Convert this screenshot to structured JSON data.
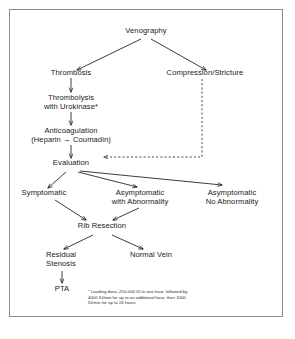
{
  "diagram": {
    "border_color": "#8d8d8d",
    "text_color": "#1a1a1a",
    "background": "#ffffff",
    "nodes": {
      "venography": "Venography",
      "thrombosis": "Thrombosis",
      "compression": "Compression/Stricture",
      "thrombolysis": "Thrombolysis\nwith Urokinase*",
      "anticoagulation": "Anticoagulation\n(Heparin → Coumadin)",
      "evaluation": "Evaluation",
      "symptomatic": "Symptomatic",
      "asymptomatic_abnormal": "Asymptomatic\nwith Abnormality",
      "asymptomatic_normal": "Asymptomatic\nNo Abnormality",
      "rib_resection": "Rib Resection",
      "residual_stenosis": "Residual\nStenosis",
      "normal_vein": "Normal Vein",
      "pta": "PTA"
    },
    "footnote": "* Loading dose–250,000 IU in one hour, followed by\n4000 IU/min for up to an additional hour, then 1000\nIU/min for up to 24 hours"
  }
}
